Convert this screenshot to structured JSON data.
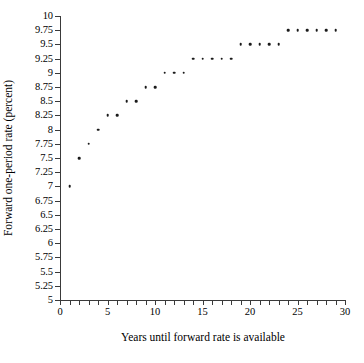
{
  "chart_data": {
    "type": "scatter",
    "title": "",
    "xlabel": "Years until forward rate is available",
    "ylabel": "Forward one-period rate (percent)",
    "xlim": [
      0,
      30
    ],
    "ylim": [
      5,
      10
    ],
    "grid": false,
    "legend": null,
    "x_tick_labels": [
      "0",
      "5",
      "10",
      "15",
      "20",
      "25",
      "30"
    ],
    "x_tick_values": [
      0,
      5,
      10,
      15,
      20,
      25,
      30
    ],
    "x_minor_tick_step": 1,
    "y_tick_labels": [
      "10",
      "9.75",
      "9.5",
      "9.25",
      "9",
      "8.75",
      "8.5",
      "8.25",
      "8",
      "7.75",
      "7.5",
      "7.25",
      "7",
      "6.75",
      "6.5",
      "6.25",
      "6",
      "5.75",
      "5.5",
      "5.25",
      "5"
    ],
    "y_tick_values": [
      10,
      9.75,
      9.5,
      9.25,
      9,
      8.75,
      8.5,
      8.25,
      8,
      7.75,
      7.5,
      7.25,
      7,
      6.75,
      6.5,
      6.25,
      6,
      5.75,
      5.5,
      5.25,
      5
    ],
    "marker": "dot",
    "marker_color": "#1a1a1a",
    "x": [
      1,
      2,
      3,
      4,
      5,
      6,
      7,
      8,
      9,
      10,
      11,
      12,
      13,
      14,
      15,
      16,
      17,
      18,
      19,
      20,
      21,
      22,
      23,
      24,
      25,
      26,
      27,
      28,
      29
    ],
    "y": [
      7,
      7.5,
      7.75,
      8,
      8.25,
      8.25,
      8.5,
      8.5,
      8.75,
      8.75,
      9,
      9,
      9,
      9.25,
      9.25,
      9.25,
      9.25,
      9.25,
      9.5,
      9.5,
      9.5,
      9.5,
      9.5,
      9.75,
      9.75,
      9.75,
      9.75,
      9.75,
      9.75
    ]
  }
}
